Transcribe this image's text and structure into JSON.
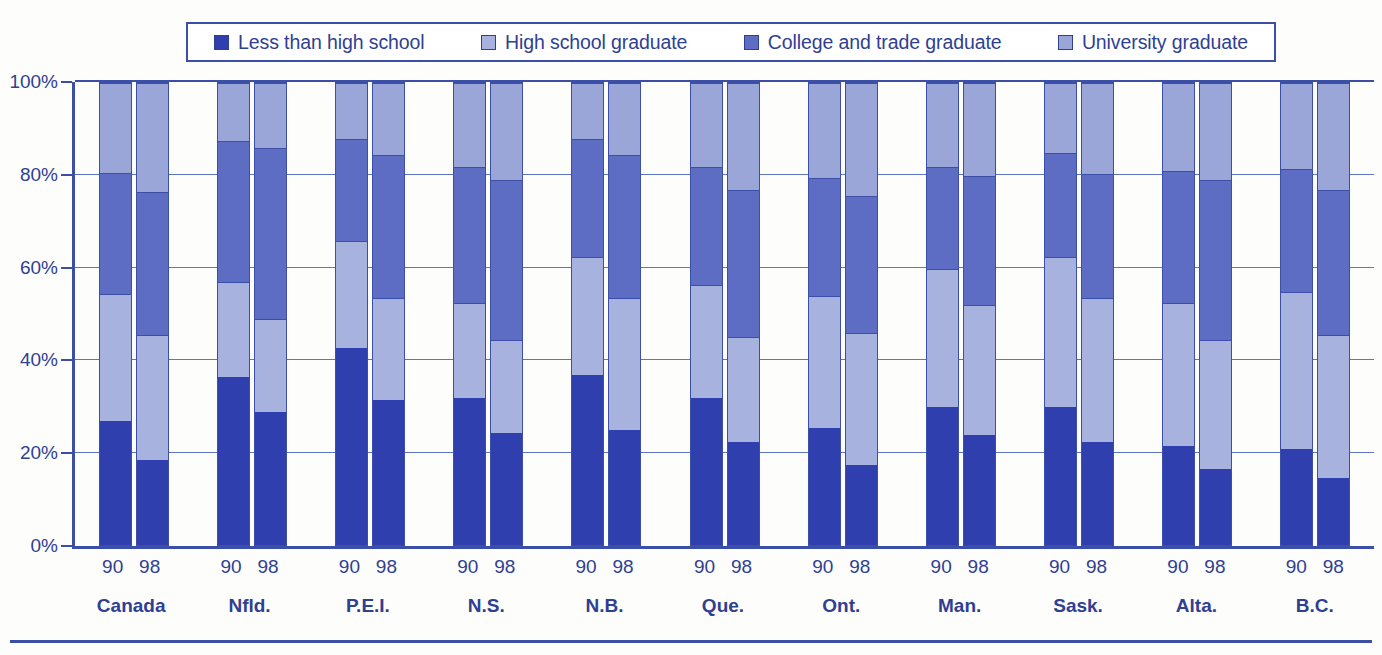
{
  "legend": {
    "items": [
      {
        "label": "Less than high school",
        "color": "#2f3fae",
        "icon": "legend-swatch-icon"
      },
      {
        "label": "High school graduate",
        "color": "#a8b2de",
        "icon": "legend-swatch-icon"
      },
      {
        "label": "College and trade graduate",
        "color": "#5e6dc4",
        "icon": "legend-swatch-icon"
      },
      {
        "label": "University graduate",
        "color": "#9aa6d8",
        "icon": "legend-swatch-icon"
      }
    ]
  },
  "axis": {
    "yticks": [
      "100%",
      "80%",
      "60%",
      "40%",
      "20%",
      "0%"
    ]
  },
  "chart_data": {
    "type": "bar",
    "subtype": "stacked-percentage",
    "title": "",
    "xlabel": "",
    "ylabel": "",
    "ylim": [
      0,
      100
    ],
    "grid": true,
    "legend_position": "top",
    "categories": [
      "Canada",
      "Nfld.",
      "P.E.I.",
      "N.S.",
      "N.B.",
      "Que.",
      "Ont.",
      "Man.",
      "Sask.",
      "Alta.",
      "B.C."
    ],
    "year_labels": [
      "90",
      "98"
    ],
    "series": [
      {
        "name": "Less than high school",
        "color": "#2f3fae",
        "values_90": [
          27.0,
          36.5,
          43.0,
          32.0,
          37.0,
          32.0,
          25.5,
          30.0,
          30.0,
          21.5,
          21.0
        ],
        "values_98": [
          18.5,
          29.0,
          31.5,
          24.5,
          25.0,
          22.5,
          17.5,
          24.0,
          22.5,
          16.5,
          14.5
        ]
      },
      {
        "name": "High school graduate",
        "color": "#a8b2de",
        "values_90": [
          27.5,
          20.5,
          23.0,
          20.5,
          25.5,
          24.5,
          28.5,
          30.0,
          32.5,
          31.0,
          34.0
        ],
        "values_98": [
          27.0,
          20.0,
          22.0,
          20.0,
          28.5,
          22.5,
          28.5,
          28.0,
          31.0,
          28.0,
          31.0
        ]
      },
      {
        "name": "College and trade graduate",
        "color": "#5e6dc4",
        "values_90": [
          26.0,
          30.5,
          22.0,
          29.5,
          25.5,
          25.5,
          25.5,
          22.0,
          22.5,
          28.5,
          26.5
        ],
        "values_98": [
          31.0,
          37.0,
          31.0,
          34.5,
          31.0,
          32.0,
          29.5,
          28.0,
          27.0,
          34.5,
          31.5
        ]
      },
      {
        "name": "University graduate",
        "color": "#9aa6d8",
        "values_90": [
          19.5,
          12.5,
          12.0,
          18.0,
          12.0,
          18.0,
          20.5,
          18.0,
          15.0,
          19.0,
          18.5
        ],
        "values_98": [
          23.5,
          14.0,
          15.5,
          21.0,
          15.5,
          23.0,
          24.5,
          20.0,
          19.5,
          21.0,
          23.0
        ]
      }
    ],
    "stack_boundaries_90": [
      [
        27.0,
        54.5,
        80.5
      ],
      [
        36.5,
        57.0,
        87.5
      ],
      [
        43.0,
        66.0,
        88.0
      ],
      [
        32.0,
        52.5,
        82.0
      ],
      [
        37.0,
        62.5,
        88.0
      ],
      [
        32.0,
        56.5,
        82.0
      ],
      [
        25.5,
        54.0,
        79.5
      ],
      [
        30.0,
        60.0,
        82.0
      ],
      [
        30.0,
        62.5,
        85.0
      ],
      [
        21.5,
        52.5,
        81.0
      ],
      [
        21.0,
        55.0,
        81.5
      ]
    ],
    "stack_boundaries_98": [
      [
        18.5,
        45.5,
        76.5
      ],
      [
        29.0,
        49.0,
        86.0
      ],
      [
        31.5,
        53.5,
        84.5
      ],
      [
        24.5,
        44.5,
        79.0
      ],
      [
        25.0,
        53.5,
        84.5
      ],
      [
        22.5,
        45.0,
        77.0
      ],
      [
        17.5,
        46.0,
        75.5
      ],
      [
        24.0,
        52.0,
        80.0
      ],
      [
        22.5,
        53.5,
        80.5
      ],
      [
        16.5,
        44.5,
        79.0
      ],
      [
        14.5,
        45.5,
        77.0
      ]
    ]
  }
}
